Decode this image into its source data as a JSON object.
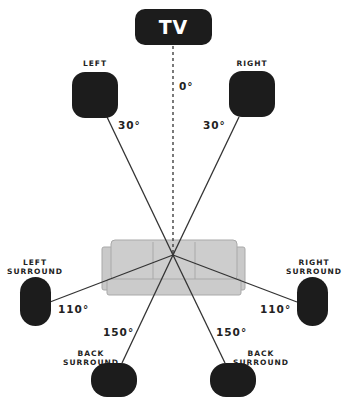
{
  "diagram": {
    "tv": {
      "label": "TV"
    },
    "speakers": {
      "left": {
        "label": "LEFT",
        "angle": "30°"
      },
      "right": {
        "label": "RIGHT",
        "angle": "30°"
      },
      "left_surround": {
        "label_line1": "LEFT",
        "label_line2": "SURROUND",
        "angle": "110°"
      },
      "right_surround": {
        "label_line1": "RIGHT",
        "label_line2": "SURROUND",
        "angle": "110°"
      },
      "back_left": {
        "label_line1": "BACK",
        "label_line2": "SURROUND",
        "angle": "150°"
      },
      "back_right": {
        "label_line1": "BACK",
        "label_line2": "SURROUND",
        "angle": "150°"
      }
    },
    "center_axis": {
      "angle": "0°"
    },
    "listening_position": {
      "name": "couch"
    },
    "colors": {
      "speaker": "#1c1c1c",
      "couch": "#c8c8c8",
      "couch_outline": "#a8a8a8",
      "line": "#333333"
    }
  }
}
